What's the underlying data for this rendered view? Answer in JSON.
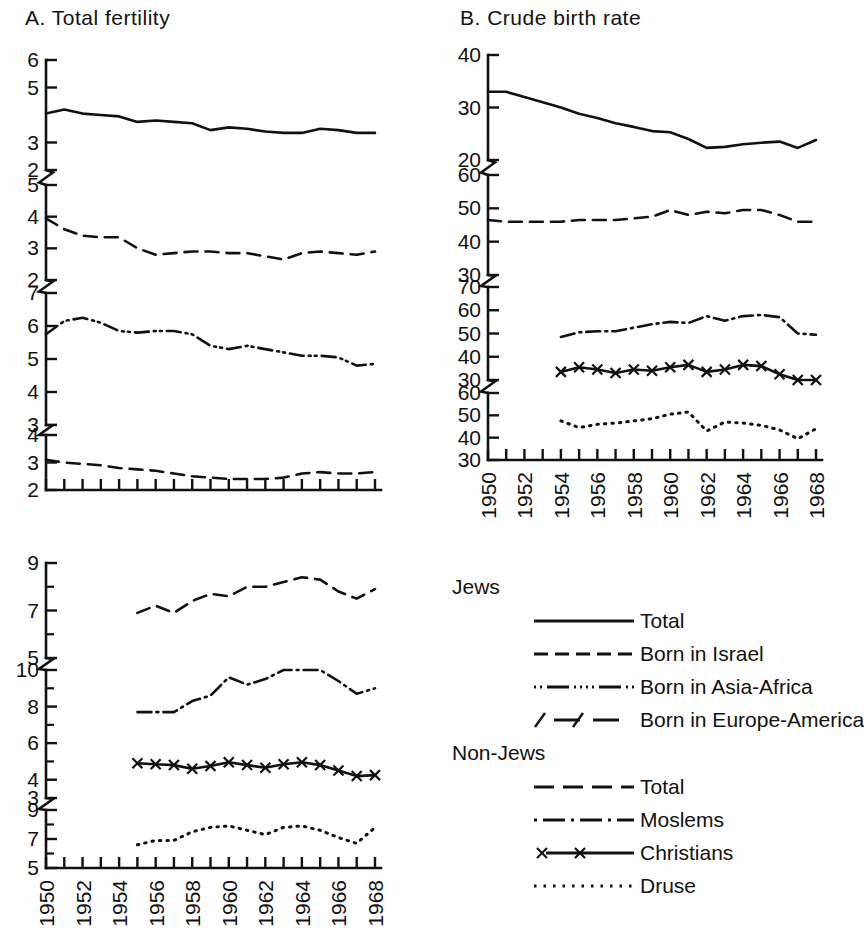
{
  "figure": {
    "panels": [
      {
        "id": "A",
        "title": "A. Total fertility"
      },
      {
        "id": "B",
        "title": "B. Crude birth rate"
      },
      {
        "id": "C",
        "title": ""
      }
    ]
  },
  "legend": {
    "groups": [
      {
        "heading": "Jews",
        "entries": [
          {
            "label": "Total",
            "style": "solid"
          },
          {
            "label": "Born in Israel",
            "style": "dash"
          },
          {
            "label": "Born in Asia-Africa",
            "style": "dashdotdot"
          },
          {
            "label": "Born in Europe-America",
            "style": "slashdash"
          }
        ]
      },
      {
        "heading": "Non-Jews",
        "entries": [
          {
            "label": "Total",
            "style": "longdash"
          },
          {
            "label": "Moslems",
            "style": "dashdot"
          },
          {
            "label": "Christians",
            "style": "xline"
          },
          {
            "label": "Druse",
            "style": "dotted"
          }
        ]
      }
    ]
  },
  "chart_data": [
    {
      "type": "line",
      "panel": "A",
      "title": "A. Total fertility",
      "xlabel": "",
      "ylabel": "",
      "grid": false,
      "legend_position": "right-external",
      "x": [
        1950,
        1951,
        1952,
        1953,
        1954,
        1955,
        1956,
        1957,
        1958,
        1959,
        1960,
        1961,
        1962,
        1963,
        1964,
        1965,
        1966,
        1967,
        1968
      ],
      "xtick_labels": [
        "1950",
        "1952",
        "1954",
        "1956",
        "1958",
        "1960",
        "1962",
        "1964",
        "1966",
        "1968"
      ],
      "segments": [
        {
          "name": "Jews Total",
          "ytick_labels": [
            "6",
            "5",
            "3",
            "2"
          ],
          "ytick_values": [
            6,
            5,
            3,
            2
          ],
          "ylim": [
            2,
            6
          ],
          "series": [
            {
              "name": "Jews - Total",
              "style": "solid",
              "values": [
                4.05,
                4.2,
                4.05,
                4.0,
                3.95,
                3.75,
                3.8,
                3.75,
                3.7,
                3.45,
                3.55,
                3.5,
                3.4,
                3.35,
                3.35,
                3.5,
                3.45,
                3.35,
                3.35
              ]
            }
          ]
        },
        {
          "name": "Jews born in Israel",
          "ytick_labels": [
            "5",
            "4",
            "3",
            "2"
          ],
          "ytick_values": [
            5,
            4,
            3,
            2
          ],
          "ylim": [
            2,
            5
          ],
          "series": [
            {
              "name": "Jews - Born in Israel",
              "style": "dash",
              "values": [
                3.95,
                3.6,
                3.4,
                3.35,
                3.35,
                3.0,
                2.8,
                2.85,
                2.9,
                2.9,
                2.85,
                2.85,
                2.75,
                2.65,
                2.85,
                2.9,
                2.85,
                2.8,
                2.9
              ]
            }
          ]
        },
        {
          "name": "Jews born in Asia-Africa",
          "ytick_labels": [
            "7",
            "6",
            "5",
            "4",
            "3"
          ],
          "ytick_values": [
            7,
            6,
            5,
            4,
            3
          ],
          "ylim": [
            3,
            7
          ],
          "series": [
            {
              "name": "Jews - Born in Asia-Africa",
              "style": "dashdotdot",
              "values": [
                5.75,
                6.15,
                6.25,
                6.1,
                5.85,
                5.8,
                5.85,
                5.85,
                5.75,
                5.4,
                5.3,
                5.4,
                5.3,
                5.2,
                5.1,
                5.1,
                5.05,
                4.8,
                4.85
              ]
            }
          ]
        },
        {
          "name": "Jews born in Europe-America",
          "ytick_labels": [
            "4",
            "3",
            "2"
          ],
          "ytick_values": [
            4,
            3,
            2
          ],
          "ylim": [
            2,
            4
          ],
          "series": [
            {
              "name": "Jews - Born in Europe-America",
              "style": "longdash",
              "values": [
                3.1,
                3.0,
                2.95,
                2.9,
                2.8,
                2.75,
                2.7,
                2.6,
                2.5,
                2.45,
                2.4,
                2.4,
                2.4,
                2.45,
                2.6,
                2.65,
                2.6,
                2.6,
                2.65
              ]
            }
          ]
        }
      ]
    },
    {
      "type": "line",
      "panel": "B",
      "title": "B. Crude birth rate",
      "xlabel": "",
      "ylabel": "",
      "grid": false,
      "legend_position": "right-external",
      "x": [
        1950,
        1951,
        1952,
        1953,
        1954,
        1955,
        1956,
        1957,
        1958,
        1959,
        1960,
        1961,
        1962,
        1963,
        1964,
        1965,
        1966,
        1967,
        1968
      ],
      "xtick_labels": [
        "1950",
        "1952",
        "1954",
        "1956",
        "1958",
        "1960",
        "1962",
        "1964",
        "1966",
        "1968"
      ],
      "segments": [
        {
          "name": "Jews Total",
          "ytick_labels": [
            "40",
            "30",
            "20"
          ],
          "ytick_values": [
            40,
            30,
            20
          ],
          "ylim": [
            20,
            40
          ],
          "series": [
            {
              "name": "Jews - Total",
              "style": "solid",
              "values": [
                33.0,
                33.0,
                32.0,
                31.0,
                30.0,
                28.8,
                28.0,
                27.0,
                26.3,
                25.5,
                25.3,
                24.0,
                22.3,
                22.5,
                23.0,
                23.3,
                23.5,
                22.3,
                23.8
              ]
            }
          ]
        },
        {
          "name": "Jews born in Israel",
          "ytick_labels": [
            "60",
            "50",
            "40",
            "30"
          ],
          "ytick_values": [
            60,
            50,
            40,
            30
          ],
          "ylim": [
            30,
            60
          ],
          "series": [
            {
              "name": "Jews - Born in Israel",
              "style": "dash",
              "values": [
                46.5,
                46.0,
                46.0,
                46.0,
                46.0,
                46.5,
                46.5,
                46.5,
                47.0,
                47.5,
                49.5,
                48.0,
                49.0,
                48.5,
                49.5,
                49.5,
                48.0,
                46.0,
                46.0
              ]
            }
          ]
        },
        {
          "name": "Non-Jews Moslems and Christians",
          "ytick_labels": [
            "70",
            "60",
            "50",
            "40",
            "30"
          ],
          "ytick_values": [
            70,
            60,
            50,
            40,
            30
          ],
          "ylim": [
            30,
            70
          ],
          "series": [
            {
              "name": "Non-Jews - Moslems",
              "style": "dashdot",
              "values": [
                null,
                null,
                null,
                null,
                48.5,
                50.5,
                51.0,
                51.0,
                52.5,
                54.0,
                55.0,
                54.5,
                57.5,
                55.5,
                57.5,
                58.0,
                57.0,
                50.0,
                49.5
              ]
            },
            {
              "name": "Non-Jews - Christians",
              "style": "xline",
              "values": [
                null,
                null,
                null,
                null,
                33.5,
                35.5,
                34.5,
                33.0,
                34.5,
                34.0,
                35.5,
                36.5,
                33.5,
                34.5,
                36.5,
                36.0,
                32.5,
                30.0,
                30.0
              ]
            }
          ]
        },
        {
          "name": "Druse",
          "ytick_labels": [
            "60",
            "50",
            "40",
            "30"
          ],
          "ytick_values": [
            60,
            50,
            40,
            30
          ],
          "ylim": [
            30,
            60
          ],
          "series": [
            {
              "name": "Non-Jews - Druse",
              "style": "dotted",
              "values": [
                null,
                null,
                null,
                null,
                47.5,
                44.5,
                46.0,
                46.5,
                47.5,
                48.5,
                50.5,
                51.5,
                43.0,
                47.0,
                46.5,
                45.5,
                43.5,
                39.5,
                44.0
              ]
            }
          ]
        }
      ]
    },
    {
      "type": "line",
      "panel": "C",
      "title": "",
      "xlabel": "",
      "ylabel": "",
      "grid": false,
      "legend_position": "right-external",
      "x": [
        1950,
        1951,
        1952,
        1953,
        1954,
        1955,
        1956,
        1957,
        1958,
        1959,
        1960,
        1961,
        1962,
        1963,
        1964,
        1965,
        1966,
        1967,
        1968
      ],
      "xtick_labels": [
        "1950",
        "1952",
        "1954",
        "1956",
        "1958",
        "1960",
        "1962",
        "1964",
        "1966",
        "1968"
      ],
      "segments": [
        {
          "name": "Non-Jews Total",
          "ytick_labels": [
            "9",
            "7",
            "5"
          ],
          "ytick_values": [
            9,
            7,
            5
          ],
          "ylim": [
            5,
            9
          ],
          "series": [
            {
              "name": "Non-Jews - Total",
              "style": "longdash",
              "values": [
                null,
                null,
                null,
                null,
                null,
                6.9,
                7.2,
                6.9,
                7.4,
                7.7,
                7.6,
                8.0,
                8.0,
                8.2,
                8.4,
                8.3,
                7.8,
                7.5,
                7.9
              ]
            }
          ]
        },
        {
          "name": "Moslems and Christians",
          "ytick_labels": [
            "10",
            "8",
            "6",
            "4",
            "3"
          ],
          "ytick_values": [
            10,
            8,
            6,
            4,
            3
          ],
          "ylim": [
            3,
            10
          ],
          "series": [
            {
              "name": "Non-Jews - Moslems",
              "style": "dashdot",
              "values": [
                null,
                null,
                null,
                null,
                null,
                7.7,
                7.7,
                7.7,
                8.3,
                8.6,
                9.6,
                9.2,
                9.5,
                10.0,
                10.0,
                10.0,
                9.4,
                8.7,
                9.0
              ]
            },
            {
              "name": "Non-Jews - Christians",
              "style": "xline",
              "values": [
                null,
                null,
                null,
                null,
                null,
                4.9,
                4.85,
                4.8,
                4.6,
                4.75,
                4.95,
                4.8,
                4.65,
                4.85,
                4.95,
                4.8,
                4.5,
                4.2,
                4.25
              ]
            }
          ]
        },
        {
          "name": "Druse",
          "ytick_labels": [
            "9",
            "7",
            "5"
          ],
          "ytick_values": [
            9,
            7,
            5
          ],
          "ylim": [
            5,
            9
          ],
          "series": [
            {
              "name": "Non-Jews - Druse",
              "style": "dotted",
              "values": [
                null,
                null,
                null,
                null,
                null,
                6.6,
                6.9,
                6.9,
                7.5,
                7.8,
                7.9,
                7.6,
                7.3,
                7.8,
                7.9,
                7.6,
                7.1,
                6.7,
                7.8
              ]
            }
          ]
        }
      ]
    }
  ]
}
